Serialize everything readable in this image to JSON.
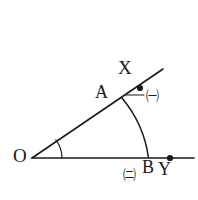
{
  "figure": {
    "stroke_color": "#1a1a1a",
    "background_color": "#ffffff",
    "labels": {
      "vertex_O": "O",
      "point_A": "A",
      "ray_end_X": "X",
      "point_B": "B",
      "ray_end_Y": "Y"
    },
    "annotations": {
      "arc_upper_mark": "㈠",
      "arc_lower_mark": "㈡"
    },
    "geometry": {
      "vertex": [
        32,
        158
      ],
      "ray_X_end": [
        163,
        69
      ],
      "ray_Y_end": [
        194,
        158
      ],
      "point_A": [
        122,
        97
      ],
      "point_B": [
        148,
        158
      ],
      "dot_on_ray_X": [
        140,
        88
      ],
      "dot_on_ray_Y": [
        170,
        158
      ],
      "arc_radius": 117,
      "angle_arc_radius": 30
    }
  }
}
